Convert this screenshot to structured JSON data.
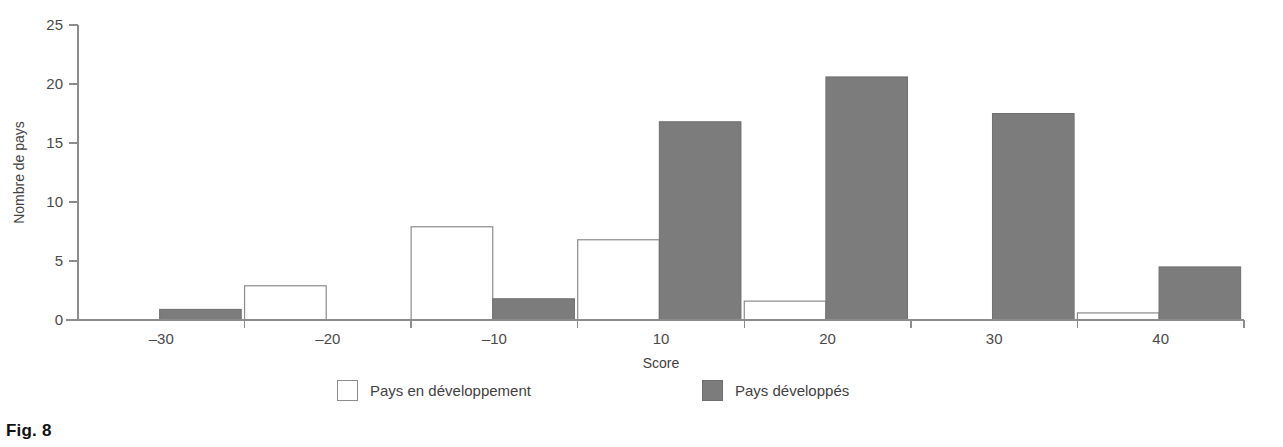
{
  "figure": {
    "caption": "Fig. 8"
  },
  "legend": {
    "items": [
      {
        "label": "Pays en développement",
        "swatch": "white-square-icon",
        "color": "#ffffff"
      },
      {
        "label": "Pays développés",
        "swatch": "gray-square-icon",
        "color": "#7c7c7c"
      }
    ]
  },
  "chart_data": {
    "type": "bar",
    "title": "",
    "xlabel": "Score",
    "ylabel": "Nombre de pays",
    "categories": [
      "-30",
      "-20",
      "-10",
      "10",
      "20",
      "30",
      "40"
    ],
    "xtick_labels": [
      "–30",
      "–20",
      "–10",
      "10",
      "20",
      "30",
      "40"
    ],
    "ytick_labels": [
      "0",
      "5",
      "10",
      "15",
      "20",
      "25"
    ],
    "yticks": [
      0,
      5,
      10,
      15,
      20,
      25
    ],
    "ylim": [
      0,
      25
    ],
    "grid": false,
    "legend_position": "bottom",
    "series": [
      {
        "name": "Pays en développement",
        "color": "#ffffff",
        "values": [
          0,
          2.9,
          7.9,
          6.8,
          1.6,
          0,
          0.6
        ]
      },
      {
        "name": "Pays développés",
        "color": "#7c7c7c",
        "values": [
          0.9,
          0,
          1.8,
          16.8,
          20.6,
          17.5,
          4.5
        ]
      }
    ]
  }
}
